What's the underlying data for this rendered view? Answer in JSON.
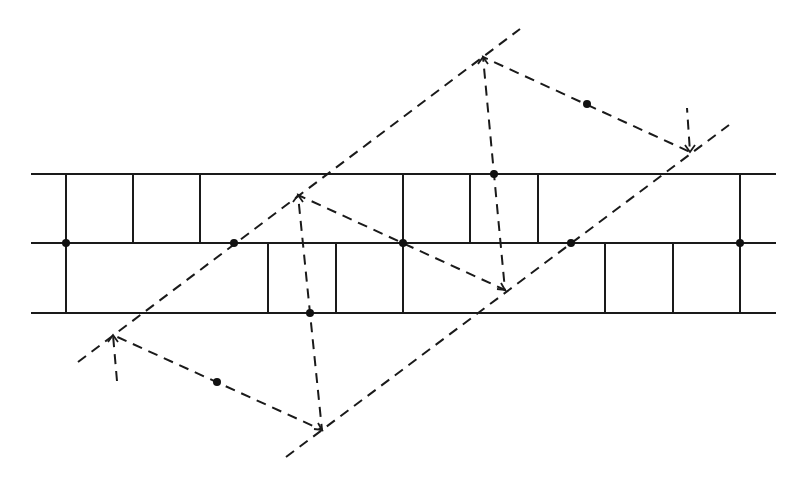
{
  "diagram": {
    "title": "",
    "colors": {
      "line": "#1a1a1a",
      "dot": "#111111",
      "background": "#ffffff"
    },
    "horizontal_lines": [
      {
        "y": 174,
        "x1": 32,
        "x2": 775
      },
      {
        "y": 243,
        "x1": 32,
        "x2": 775
      },
      {
        "y": 313,
        "x1": 32,
        "x2": 775
      }
    ],
    "solid_segments": [
      [
        66,
        174,
        66,
        313
      ],
      [
        66,
        243,
        133,
        243
      ],
      [
        133,
        243,
        133,
        174
      ],
      [
        200,
        174,
        200,
        243
      ],
      [
        200,
        243,
        268,
        243
      ],
      [
        268,
        243,
        268,
        313
      ],
      [
        336,
        313,
        336,
        243
      ],
      [
        336,
        243,
        403,
        243
      ],
      [
        403,
        174,
        403,
        313
      ],
      [
        403,
        243,
        470,
        243
      ],
      [
        470,
        243,
        470,
        174
      ],
      [
        538,
        174,
        538,
        243
      ],
      [
        538,
        243,
        605,
        243
      ],
      [
        605,
        243,
        605,
        313
      ],
      [
        673,
        313,
        673,
        243
      ],
      [
        673,
        243,
        740,
        243
      ],
      [
        740,
        174,
        740,
        313
      ]
    ],
    "dashed_lines": [
      {
        "name": "glide-axis-upper",
        "x1": 78,
        "y1": 362,
        "x2": 520,
        "y2": 29
      },
      {
        "name": "glide-axis-lower",
        "x1": 286,
        "y1": 457,
        "x2": 729,
        "y2": 125
      }
    ],
    "dashed_paths": [
      {
        "name": "path-left-bottom",
        "points": [
          [
            117,
            381
          ],
          [
            113,
            335
          ],
          [
            322,
            430
          ],
          [
            310,
            313
          ],
          [
            298,
            195
          ],
          [
            505,
            290
          ],
          [
            494,
            174
          ],
          [
            483,
            57
          ],
          [
            690,
            152
          ],
          [
            687,
            108
          ]
        ]
      }
    ],
    "arrowheads": [
      {
        "x": 113,
        "y": 335,
        "dir": "up"
      },
      {
        "x": 322,
        "y": 430,
        "dir": "down-right"
      },
      {
        "x": 298,
        "y": 195,
        "dir": "up"
      },
      {
        "x": 505,
        "y": 290,
        "dir": "down-right"
      },
      {
        "x": 483,
        "y": 57,
        "dir": "up"
      },
      {
        "x": 690,
        "y": 152,
        "dir": "down"
      }
    ],
    "dots": [
      {
        "x": 66,
        "y": 243
      },
      {
        "x": 234,
        "y": 243
      },
      {
        "x": 403,
        "y": 243
      },
      {
        "x": 571,
        "y": 243
      },
      {
        "x": 740,
        "y": 243
      },
      {
        "x": 310,
        "y": 313
      },
      {
        "x": 494,
        "y": 174
      },
      {
        "x": 217,
        "y": 382
      },
      {
        "x": 587,
        "y": 104
      }
    ]
  }
}
